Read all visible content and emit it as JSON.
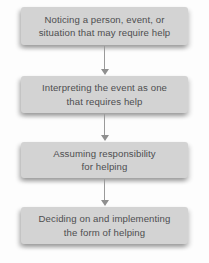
{
  "diagram": {
    "name": "helping-decision-flowchart",
    "colors": {
      "box_fill": "#d3d3d3",
      "box_text": "#4e4e50",
      "arrow": "#979797",
      "background": "#fdfdfd"
    },
    "steps": [
      {
        "label": "Noticing a person, event, or situation that may require help",
        "lines": [
          "Noticing a person, event, or",
          "situation that may require help"
        ]
      },
      {
        "label": "Interpreting the event as one that requires help",
        "lines": [
          "Interpreting the event as one",
          "that requires help"
        ]
      },
      {
        "label": "Assuming responsibility for helping",
        "lines": [
          "Assuming responsibility",
          "for helping"
        ]
      },
      {
        "label": "Deciding on and implementing the form of helping",
        "lines": [
          "Deciding on and implementing",
          "the form of helping"
        ]
      }
    ]
  }
}
